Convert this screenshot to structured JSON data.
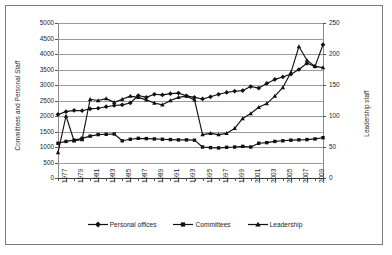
{
  "chart_data": {
    "type": "line",
    "title": "",
    "xlabel": "",
    "ylabel": "Committees and Personal Staff",
    "ylabel_secondary": "Leadership staff",
    "grid": true,
    "legend_position": "bottom",
    "x": [
      1977,
      1978,
      1979,
      1980,
      1981,
      1982,
      1983,
      1984,
      1985,
      1986,
      1987,
      1988,
      1989,
      1990,
      1991,
      1992,
      1993,
      1994,
      1995,
      1996,
      1997,
      1998,
      1999,
      2000,
      2001,
      2002,
      2003,
      2004,
      2005,
      2006,
      2007,
      2008,
      2009,
      2010
    ],
    "xtick_labels": [
      "1977",
      "1979",
      "1981",
      "1983",
      "1985",
      "1987",
      "1989",
      "1991",
      "1993",
      "1995",
      "1997",
      "1999",
      "2001",
      "2003",
      "2005",
      "2007",
      "2009"
    ],
    "ylim": [
      0,
      5000
    ],
    "ytick_labels": [
      "0",
      "500",
      "1000",
      "1500",
      "2000",
      "2500",
      "3000",
      "3500",
      "4000",
      "4500",
      "5000"
    ],
    "ylim_secondary": [
      0,
      250
    ],
    "ytick_labels_secondary": [
      "0",
      "50",
      "100",
      "150",
      "200",
      "250"
    ],
    "series": [
      {
        "name": "Personal offices",
        "axis": "left",
        "marker": "diamond",
        "color": "#111111",
        "values": [
          2050,
          2140,
          2180,
          2170,
          2230,
          2250,
          2300,
          2340,
          2360,
          2420,
          2660,
          2600,
          2700,
          2680,
          2720,
          2740,
          2650,
          2600,
          2550,
          2620,
          2700,
          2760,
          2800,
          2820,
          2950,
          2900,
          3050,
          3180,
          3260,
          3350,
          3500,
          3700,
          3600,
          4300
        ]
      },
      {
        "name": "Committees",
        "axis": "left",
        "marker": "square",
        "color": "#111111",
        "values": [
          1120,
          1180,
          1220,
          1280,
          1350,
          1400,
          1410,
          1420,
          1200,
          1250,
          1280,
          1270,
          1260,
          1250,
          1240,
          1230,
          1230,
          1220,
          1000,
          980,
          970,
          990,
          1000,
          1020,
          1000,
          1120,
          1140,
          1180,
          1200,
          1220,
          1230,
          1240,
          1260,
          1300
        ]
      },
      {
        "name": "Leadership",
        "axis": "right",
        "marker": "triangle",
        "color": "#111111",
        "values": [
          41,
          100,
          60,
          62,
          127,
          125,
          128,
          122,
          127,
          132,
          130,
          126,
          121,
          118,
          125,
          130,
          132,
          126,
          70,
          72,
          70,
          72,
          80,
          96,
          104,
          114,
          120,
          132,
          146,
          170,
          212,
          190,
          180,
          178
        ]
      }
    ]
  },
  "legend": {
    "items": [
      {
        "label": "Personal offices",
        "marker": "diamond"
      },
      {
        "label": "Committees",
        "marker": "square"
      },
      {
        "label": "Leadership",
        "marker": "triangle"
      }
    ]
  }
}
